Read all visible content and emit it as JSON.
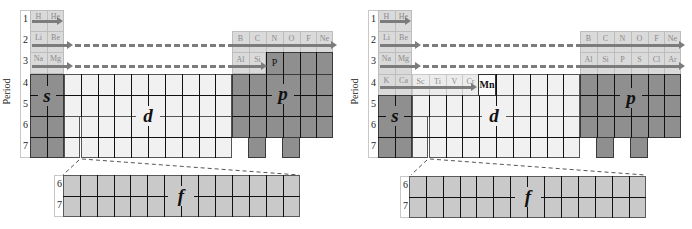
{
  "axis_label": "Period",
  "period_labels": [
    "1",
    "2",
    "3",
    "4",
    "5",
    "6",
    "7"
  ],
  "f_period_labels": [
    "6",
    "7"
  ],
  "blocks": {
    "s": "s",
    "p": "p",
    "d": "d",
    "f": "f"
  },
  "colors": {
    "filled_shell": "#dadada",
    "s_p_block": "#8f8f8f",
    "d_block": "#f1f1f1",
    "f_block": "#c9c9c9",
    "arrow": "#7c7c7c"
  },
  "left_panel": {
    "s_elements": [
      [
        "H",
        "He"
      ],
      [
        "Li",
        "Be"
      ],
      [
        "Na",
        "Mg"
      ]
    ],
    "p_elements_row2": [
      "B",
      "C",
      "N",
      "O",
      "F",
      "Ne"
    ],
    "p_elements_row3": [
      "Al",
      "Si"
    ],
    "highlight": "P"
  },
  "right_panel": {
    "s_elements": [
      [
        "H",
        "He"
      ],
      [
        "Li",
        "Be"
      ],
      [
        "Na",
        "Mg"
      ],
      [
        "K",
        "Ca"
      ]
    ],
    "p_elements_row2": [
      "B",
      "C",
      "N",
      "O",
      "F",
      "Ne"
    ],
    "p_elements_row3": [
      "Al",
      "Si",
      "P",
      "S",
      "Cl",
      "Ar"
    ],
    "d_elements_row4": [
      "Sc",
      "Ti",
      "V",
      "Cr"
    ],
    "highlight": "Mn"
  }
}
